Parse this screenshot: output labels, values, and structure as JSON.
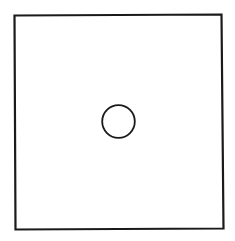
{
  "diagram": {
    "title": "",
    "shapes": [
      {
        "id": "outer-square",
        "kind": "square",
        "fill": "none",
        "stroke": "#1a1a1a"
      },
      {
        "id": "center-circle",
        "kind": "circle",
        "fill": "none",
        "stroke": "#1a1a1a",
        "position": "center"
      }
    ],
    "colors": {
      "background": "#ffffff",
      "stroke": "#1a1a1a"
    }
  }
}
